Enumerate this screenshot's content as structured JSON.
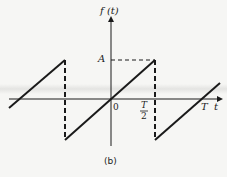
{
  "figure": {
    "y_axis_label": "f (t)",
    "x_axis_label": "t",
    "amplitude_label": "A",
    "origin_label": "0",
    "half_period_num": "T",
    "half_period_den": "2",
    "period_label": "T",
    "caption": "(b)"
  },
  "colors": {
    "line": "#1a1a1a",
    "background": "#f6f6f4"
  }
}
